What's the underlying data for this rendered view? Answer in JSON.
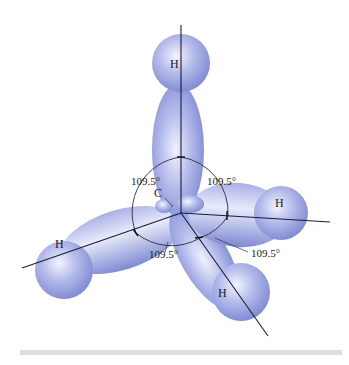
{
  "diagram": {
    "type": "molecular-orbital",
    "central_atom": {
      "label": "C"
    },
    "bonded_atoms": [
      {
        "label": "H",
        "position": "top"
      },
      {
        "label": "H",
        "position": "right"
      },
      {
        "label": "H",
        "position": "bottom-right"
      },
      {
        "label": "H",
        "position": "left"
      }
    ],
    "bond_angles": [
      {
        "label": "109.5°",
        "position": "upper-left"
      },
      {
        "label": "109.5°",
        "position": "upper-right"
      },
      {
        "label": "109.5°",
        "position": "lower-right"
      },
      {
        "label": "109.5°",
        "position": "lower-center"
      }
    ],
    "colors": {
      "lobe_fill": "#8b96dc",
      "lobe_highlight": "#eef0fb",
      "axis_line": "#1b1b3a",
      "divider": "#dedede"
    }
  }
}
